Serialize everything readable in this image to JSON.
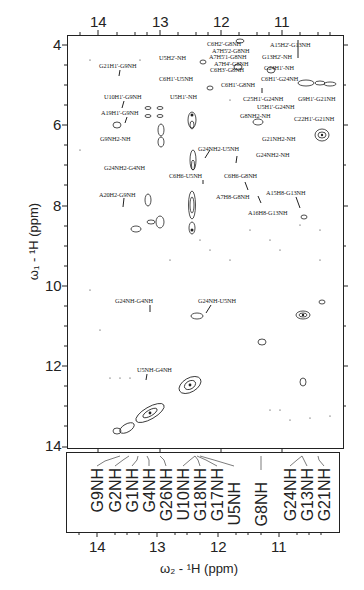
{
  "figure": {
    "x_axis_title": "ω₂ - ¹H  (ppm)",
    "y_axis_title": "ω₁ - ¹H  (ppm)",
    "top_x_ticks": [
      "14",
      "13",
      "12",
      "11"
    ],
    "bottom_x_ticks": [
      "14",
      "13",
      "12",
      "11"
    ],
    "y_ticks": [
      "4",
      "6",
      "8",
      "10",
      "12",
      "14"
    ]
  },
  "annotations": [
    {
      "text": "G21H1'-G9NH",
      "x": 99,
      "y": 62
    },
    {
      "text": "U5H2'-NH",
      "x": 159,
      "y": 54
    },
    {
      "text": "C6H1'-U5NH",
      "x": 159,
      "y": 75
    },
    {
      "text": "U10H1'-G9NH",
      "x": 104,
      "y": 93
    },
    {
      "text": "U5H1'-NH",
      "x": 170,
      "y": 93
    },
    {
      "text": "A19H1'-G9NH",
      "x": 101,
      "y": 109
    },
    {
      "text": "G9NH2-NH",
      "x": 100,
      "y": 135
    },
    {
      "text": "C6H2'-G8NH",
      "x": 207,
      "y": 40
    },
    {
      "text": "A7H5'2-G8NH",
      "x": 212,
      "y": 47
    },
    {
      "text": "A7H5'1-G8NH",
      "x": 209,
      "y": 53
    },
    {
      "text": "A7H4'-G8NH",
      "x": 214,
      "y": 60
    },
    {
      "text": "C6H3'-G8NH",
      "x": 210,
      "y": 66
    },
    {
      "text": "A15H2'-G13NH",
      "x": 270,
      "y": 41
    },
    {
      "text": "G13H2'-NH",
      "x": 262,
      "y": 53
    },
    {
      "text": "G24H1'-NH",
      "x": 264,
      "y": 64
    },
    {
      "text": "C6H1'-G24NH",
      "x": 261,
      "y": 75
    },
    {
      "text": "C6H1'-G8NH",
      "x": 221,
      "y": 81
    },
    {
      "text": "C25H1'-G24NH",
      "x": 243,
      "y": 95
    },
    {
      "text": "G9H1'-G21NH",
      "x": 298,
      "y": 95
    },
    {
      "text": "U5H1'-G24NH",
      "x": 257,
      "y": 103
    },
    {
      "text": "G8NH2-NH",
      "x": 240,
      "y": 112
    },
    {
      "text": "C22H1'-G21NH",
      "x": 294,
      "y": 115
    },
    {
      "text": "G21NH2-NH",
      "x": 262,
      "y": 135
    },
    {
      "text": "G24NH2-U5NH",
      "x": 198,
      "y": 145
    },
    {
      "text": "G24NH2-NH",
      "x": 256,
      "y": 151
    },
    {
      "text": "G24NH2-G4NH",
      "x": 104,
      "y": 164
    },
    {
      "text": "C6H6-U5NH",
      "x": 169,
      "y": 172
    },
    {
      "text": "C6H6-G8NH",
      "x": 224,
      "y": 172
    },
    {
      "text": "A20H2-G9NH",
      "x": 99,
      "y": 191
    },
    {
      "text": "A7H8-G8NH",
      "x": 216,
      "y": 193
    },
    {
      "text": "A15H8-G13NH",
      "x": 266,
      "y": 189
    },
    {
      "text": "A16H8-G13NH",
      "x": 248,
      "y": 209
    },
    {
      "text": "G24NH-G4NH",
      "x": 115,
      "y": 297
    },
    {
      "text": "G24NH-U5NH",
      "x": 198,
      "y": 297
    },
    {
      "text": "U5NH-G4NH",
      "x": 137,
      "y": 366
    }
  ],
  "assignments": [
    {
      "label": "G9NH",
      "x": 97
    },
    {
      "label": "G2NH",
      "x": 115
    },
    {
      "label": "G1NH",
      "x": 132
    },
    {
      "label": "G4NH",
      "x": 149
    },
    {
      "label": "G26NH",
      "x": 166
    },
    {
      "label": "U10NH",
      "x": 183
    },
    {
      "label": "G18NH",
      "x": 200
    },
    {
      "label": "G17NH",
      "x": 217
    },
    {
      "label": "U5NH",
      "x": 234
    },
    {
      "label": "G8NH",
      "x": 261
    },
    {
      "label": "G24NH",
      "x": 290
    },
    {
      "label": "G13NH",
      "x": 307
    },
    {
      "label": "G21NH",
      "x": 324
    }
  ]
}
